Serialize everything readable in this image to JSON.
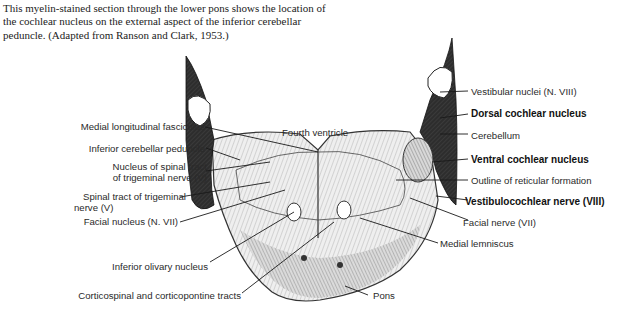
{
  "caption": "This myelin-stained section through the lower pons shows the location of the cochlear nucleus on the external aspect of the inferior cerebellar peduncle. (Adapted from Ranson and Clark, 1953.)",
  "center_label": "Fourth ventricle",
  "labels_left": [
    "Medial longitudinal fasciculus",
    "Inferior cerebellar peduncle",
    "Nucleus of spinal tract",
    "of trigeminal nerve (V)",
    "Spinal tract of trigeminal",
    "nerve (V)",
    "Facial nucleus (N. VII)",
    "Inferior olivary nucleus",
    "Corticospinal and corticopontine tracts"
  ],
  "labels_right": [
    "Vestibular nuclei (N. VIII)",
    "Dorsal cochlear nucleus",
    "Cerebellum",
    "Ventral cochlear nucleus",
    "Outline of reticular formation",
    "Vestibulocochlear nerve (VIII)",
    "Facial nerve (VII)",
    "Medial lemniscus",
    "Pons"
  ],
  "colors": {
    "ink": "#1a1a1a",
    "tissue_light": "#e9e9e9",
    "tissue_dark": "#2b2b2b",
    "text": "#2a2a2a"
  }
}
